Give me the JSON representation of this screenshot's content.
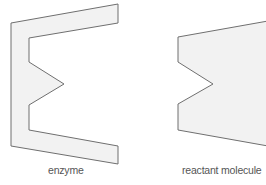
{
  "diagram": {
    "colors": {
      "fill": "#f2f2f2",
      "stroke": "#6f6f6f",
      "label": "#555555",
      "background": "#ffffff"
    },
    "shapes": [
      {
        "id": "enzyme",
        "label": "enzyme",
        "points": "11,23 118,4 118,23 29,38 29,62 64,84 29,105 29,130 118,146 118,164 11,146"
      },
      {
        "id": "reactant",
        "label": "reactant molecule",
        "points": "178,37 268,21 268,146 178,130 178,104 213,84 178,62"
      }
    ]
  }
}
